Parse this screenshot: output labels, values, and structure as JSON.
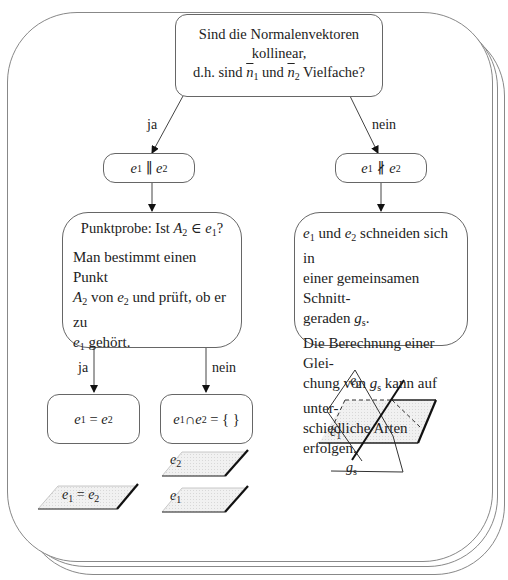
{
  "question_box": {
    "line1": "Sind die Normalenvektoren",
    "line2": "kollinear,",
    "line3_prefix": "d.h. sind",
    "n1": "n",
    "n1_sub": "1",
    "and": "und",
    "n2": "n",
    "n2_sub": "2",
    "line3_suffix": "Vielfache?"
  },
  "branch_labels": {
    "yes_top": "ja",
    "no_top": "nein",
    "yes_bottom": "ja",
    "no_bottom": "nein"
  },
  "parallel_box": {
    "e1": "e",
    "sub1": "1",
    "symbol": "∥",
    "e2": "e",
    "sub2": "2"
  },
  "not_parallel_box": {
    "e1": "e",
    "sub1": "1",
    "symbol": "∦",
    "e2": "e",
    "sub2": "2"
  },
  "point_test_box": {
    "title_prefix": "Punktprobe: Ist",
    "title_point": "A",
    "title_point_sub": "2",
    "title_in": "∈",
    "title_plane": "e",
    "title_plane_sub": "1",
    "title_suffix": "?",
    "body_line1": "Man bestimmt einen Punkt",
    "body_point": "A",
    "body_point_sub": "2",
    "body_line2_mid": "von",
    "body_plane": "e",
    "body_plane_sub": "2",
    "body_line2_suffix": "und prüft, ob er zu",
    "body_plane2": "e",
    "body_plane2_sub": "1",
    "body_line3_suffix": "gehört."
  },
  "intersect_box": {
    "e1": "e",
    "sub1": "1",
    "and": "und",
    "e2": "e",
    "sub2": "2",
    "line1_suffix": "schneiden sich in",
    "line2": "einer gemeinsamen Schnitt-",
    "line3_prefix": "geraden",
    "g": "g",
    "g_sub": "s",
    "line3_suffix": ".",
    "line4": "Die Berechnung einer Glei-",
    "line5_prefix": "chung von",
    "g2": "g",
    "g2_sub": "s",
    "line5_suffix": "kann auf unter-",
    "line6": "schiedliche Arten erfolgen."
  },
  "equal_box": {
    "e1": "e",
    "sub1": "1",
    "symbol": "=",
    "e2": "e",
    "sub2": "2"
  },
  "disjoint_box": {
    "e1": "e",
    "sub1": "1",
    "symbol": "∩",
    "e2": "e",
    "sub2": "2",
    "rhs": "= { }"
  },
  "illustrations": {
    "identical_plane_label": {
      "e1": "e",
      "sub1": "1",
      "symbol": "=",
      "e2": "e",
      "sub2": "2"
    },
    "parallel_upper_label": {
      "e": "e",
      "sub": "2"
    },
    "parallel_lower_label": {
      "e": "e",
      "sub": "1"
    },
    "intersect_e2_label": {
      "e": "e",
      "sub": "2"
    },
    "intersect_e1_label": {
      "e": "e",
      "sub": "1"
    },
    "intersect_line_label": {
      "g": "g",
      "sub": "s"
    }
  }
}
